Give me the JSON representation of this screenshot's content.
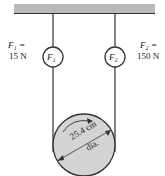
{
  "diagram": {
    "left_force_label": "F₁ =",
    "left_force_value": "15 N",
    "right_force_label": "F₂ =",
    "right_force_value": "150 N",
    "left_scale_text": "F₁",
    "right_scale_text": "F₂",
    "pulley_diameter": "25.4 cm",
    "pulley_diameter_suffix": "dia.",
    "colors": {
      "ceiling": "#b9b9b9",
      "pulley": "#d4d4d4",
      "line": "#333333"
    }
  }
}
